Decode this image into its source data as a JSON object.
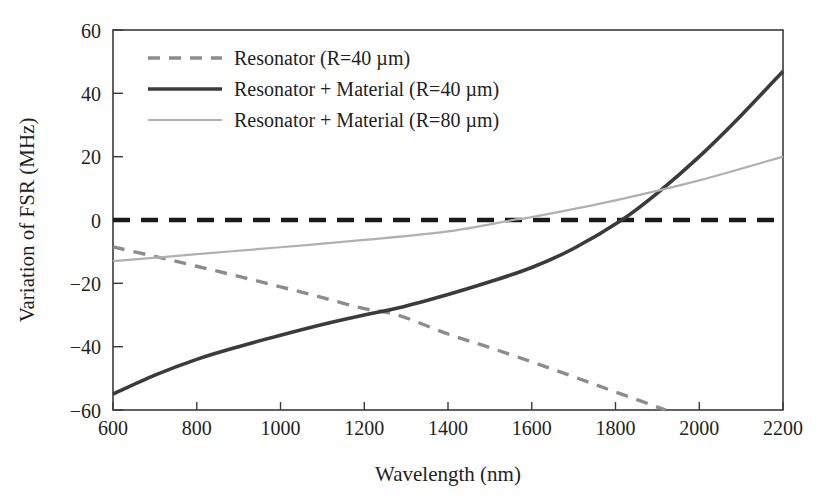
{
  "chart_data": {
    "type": "line",
    "title": "",
    "xlabel": "Wavelength (nm)",
    "ylabel": "Variation of FSR (MHz)",
    "xlim": [
      600,
      2200
    ],
    "ylim": [
      -60,
      60
    ],
    "xticks": [
      600,
      800,
      1000,
      1200,
      1400,
      1600,
      1800,
      2000,
      2200
    ],
    "yticks": [
      -60,
      -40,
      -20,
      0,
      20,
      40,
      60
    ],
    "grid": false,
    "legend_position": "upper-left-inside",
    "series": [
      {
        "name": "Resonator (R=40 µm)",
        "style": "dashed",
        "color": "#8c8c8c",
        "x": [
          600,
          700,
          800,
          900,
          1000,
          1100,
          1200,
          1280,
          1400,
          1500,
          1600,
          1700,
          1800,
          1920
        ],
        "values": [
          -8.5,
          -11.5,
          -14.6,
          -17.8,
          -21.1,
          -24.5,
          -28.0,
          -30.0,
          -36.0,
          -40.3,
          -44.8,
          -49.5,
          -54.3,
          -60.0
        ]
      },
      {
        "name": "Resonator + Material (R=40 µm)",
        "style": "solid-thick",
        "color": "#3b3b3b",
        "x": [
          600,
          700,
          800,
          900,
          1000,
          1100,
          1200,
          1280,
          1400,
          1500,
          1600,
          1700,
          1815,
          1900,
          2000,
          2100,
          2200
        ],
        "values": [
          -55.0,
          -49.0,
          -44.0,
          -40.0,
          -36.4,
          -33.0,
          -30.0,
          -27.8,
          -23.5,
          -19.5,
          -15.0,
          -9.0,
          0.0,
          8.5,
          20.0,
          33.0,
          47.0
        ]
      },
      {
        "name": "Resonator + Material (R=80 µm)",
        "style": "solid-thin",
        "color": "#b0b0b0",
        "x": [
          600,
          800,
          1000,
          1200,
          1400,
          1555,
          1600,
          1800,
          2000,
          2200
        ],
        "values": [
          -13.0,
          -10.8,
          -8.6,
          -6.3,
          -3.6,
          0.0,
          0.9,
          6.2,
          12.5,
          20.0
        ]
      }
    ],
    "zero_reference_line": {
      "name": "zero-reference",
      "y": 0,
      "style": "dashed-bold-black",
      "color": "#1a1a1a"
    }
  },
  "legend": {
    "entries": [
      {
        "label": "Resonator (R=40 µm)",
        "swatch": "dashed-gray"
      },
      {
        "label": "Resonator + Material (R=40 µm)",
        "swatch": "solid-dark"
      },
      {
        "label": "Resonator + Material (R=80 µm)",
        "swatch": "solid-lightgray"
      }
    ]
  },
  "axes": {
    "x_title": "Wavelength (nm)",
    "y_title": "Variation of FSR (MHz)",
    "x_tick_labels": [
      "600",
      "800",
      "1000",
      "1200",
      "1400",
      "1600",
      "1800",
      "2000",
      "2200"
    ],
    "y_tick_labels": [
      "60",
      "40",
      "20",
      "0",
      "−20",
      "−40",
      "−60"
    ]
  },
  "colors": {
    "frame": "#3a3a3a",
    "text": "#231f20",
    "series_resonator": "#8c8c8c",
    "series_resmat40": "#3b3b3b",
    "series_resmat80": "#b0b0b0",
    "zero_line": "#1a1a1a",
    "background": "#ffffff"
  }
}
